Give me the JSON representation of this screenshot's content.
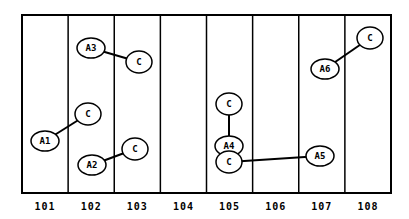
{
  "diagram": {
    "frame": {
      "x": 22,
      "y": 15,
      "width": 369,
      "height": 178
    },
    "columns": [
      {
        "label": "101"
      },
      {
        "label": "102"
      },
      {
        "label": "103"
      },
      {
        "label": "104"
      },
      {
        "label": "105"
      },
      {
        "label": "106"
      },
      {
        "label": "107"
      },
      {
        "label": "108"
      }
    ],
    "pairs": [
      {
        "a": {
          "label": "A1",
          "x": 45,
          "y": 141
        },
        "c": {
          "label": "C",
          "x": 88,
          "y": 114
        }
      },
      {
        "a": {
          "label": "A2",
          "x": 92,
          "y": 165
        },
        "c": {
          "label": "C",
          "x": 135,
          "y": 149
        }
      },
      {
        "a": {
          "label": "A3",
          "x": 91,
          "y": 48
        },
        "c": {
          "label": "C",
          "x": 139,
          "y": 62
        }
      },
      {
        "a": {
          "label": "A4",
          "x": 229,
          "y": 146
        },
        "c": {
          "label": "C",
          "x": 229,
          "y": 104
        }
      },
      {
        "a": {
          "label": "A5",
          "x": 320,
          "y": 156
        },
        "c": {
          "label": "C",
          "x": 229,
          "y": 162
        }
      },
      {
        "a": {
          "label": "A6",
          "x": 325,
          "y": 69
        },
        "c": {
          "label": "C",
          "x": 370,
          "y": 38
        }
      }
    ],
    "colors": {
      "stroke": "#000000",
      "fill": "#ffffff"
    }
  }
}
